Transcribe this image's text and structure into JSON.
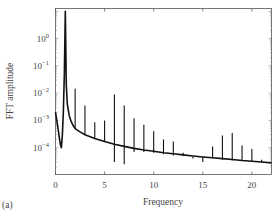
{
  "panel_label": "(a)",
  "chart_data": {
    "type": "line",
    "title": "",
    "xlabel": "Frequency",
    "ylabel": "FFT amplitude",
    "xlim": [
      0,
      22
    ],
    "ylim_log10": [
      -4.98,
      1.1
    ],
    "yscale": "log",
    "grid": false,
    "legend": null,
    "x_ticks": [
      0,
      5,
      10,
      15,
      20
    ],
    "x_tick_labels": [
      "0",
      "5",
      "10",
      "15",
      "20"
    ],
    "y_ticks_log10": [
      0,
      -1,
      -2,
      -3,
      -4
    ],
    "y_tick_labels": [
      {
        "base": "10",
        "exp": "0"
      },
      {
        "base": "10",
        "exp": "−1"
      },
      {
        "base": "10",
        "exp": "−2"
      },
      {
        "base": "10",
        "exp": "−3"
      },
      {
        "base": "10",
        "exp": "−4"
      }
    ],
    "baseline_curve": {
      "x": [
        0.0,
        0.1,
        0.2,
        0.3,
        0.4,
        0.5,
        0.6,
        0.7,
        0.8,
        0.9,
        1.0,
        1.1,
        1.2,
        1.4,
        1.6,
        1.8,
        2.0,
        2.5,
        3,
        4,
        5,
        6,
        7,
        8,
        9,
        10,
        11,
        12,
        13,
        14,
        15,
        16,
        17,
        18,
        19,
        20,
        21,
        22
      ],
      "y": [
        0.002,
        0.0012,
        0.0007,
        0.0004,
        0.00022,
        0.00013,
        0.0001,
        0.0003,
        0.002,
        0.05,
        10,
        0.02,
        0.004,
        0.0015,
        0.0009,
        0.00065,
        0.0005,
        0.00038,
        0.0003,
        0.00022,
        0.00017,
        0.000135,
        0.000112,
        9.5e-05,
        8.3e-05,
        7.4e-05,
        6.6e-05,
        6e-05,
        5.5e-05,
        5e-05,
        4.6e-05,
        4.3e-05,
        4e-05,
        3.7e-05,
        3.4e-05,
        3.2e-05,
        3e-05,
        2.8e-05
      ]
    },
    "spikes": [
      {
        "x": 2,
        "top": 0.0145,
        "bottom": 0.0005
      },
      {
        "x": 3,
        "top": 0.0035,
        "bottom": 0.0003
      },
      {
        "x": 4,
        "top": 0.00085,
        "bottom": 0.00022
      },
      {
        "x": 5,
        "top": 0.001,
        "bottom": 0.00017
      },
      {
        "x": 6,
        "top": 0.009,
        "bottom": 3e-05
      },
      {
        "x": 7,
        "top": 0.0035,
        "bottom": 2.5e-05
      },
      {
        "x": 8,
        "top": 0.0012,
        "bottom": 7e-05
      },
      {
        "x": 9,
        "top": 0.0007,
        "bottom": 7e-05
      },
      {
        "x": 10,
        "top": 0.0004,
        "bottom": 6.5e-05
      },
      {
        "x": 11,
        "top": 0.0002,
        "bottom": 5.8e-05
      },
      {
        "x": 12,
        "top": 0.00017,
        "bottom": 5.2e-05
      },
      {
        "x": 13,
        "top": 6.5e-05,
        "bottom": 5e-05
      },
      {
        "x": 14,
        "top": 4e-05,
        "bottom": 4.6e-05
      },
      {
        "x": 15,
        "top": 4.6e-05,
        "bottom": 3e-05
      },
      {
        "x": 16,
        "top": 0.00011,
        "bottom": 4e-05
      },
      {
        "x": 17,
        "top": 0.00028,
        "bottom": 3.6e-05
      },
      {
        "x": 18,
        "top": 0.00035,
        "bottom": 3.4e-05
      },
      {
        "x": 19,
        "top": 0.00012,
        "bottom": 3.4e-05
      },
      {
        "x": 20,
        "top": 9e-05,
        "bottom": 3.2e-05
      },
      {
        "x": 21,
        "top": 3.6e-05,
        "bottom": 2.8e-05
      }
    ]
  }
}
